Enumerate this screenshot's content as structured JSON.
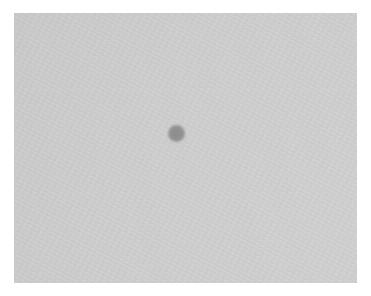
{
  "page": {
    "background_color": "#ffffff",
    "width": 371,
    "height": 296
  },
  "photo": {
    "caption": "",
    "alt_text": "Planetary transit across the solar disc",
    "frame": {
      "x": 14,
      "y": 13,
      "width": 343,
      "height": 270,
      "border_color": "#ffffff"
    },
    "sky": {
      "name": "background-sky",
      "color_dark": "#050505",
      "color_light": "#262626"
    },
    "solar_disc": {
      "name": "solar-disc",
      "color_center": "#d2d2d2",
      "color_limb": "#9a9a9a",
      "center_x": 430,
      "center_y": 490,
      "radius": 440
    },
    "planet": {
      "name": "transiting-planet",
      "color": "#8e8e8e",
      "center_x": 176,
      "center_y": 133,
      "radius": 8
    },
    "limb_glow": {
      "name": "limb-glow",
      "color": "#969696"
    }
  }
}
